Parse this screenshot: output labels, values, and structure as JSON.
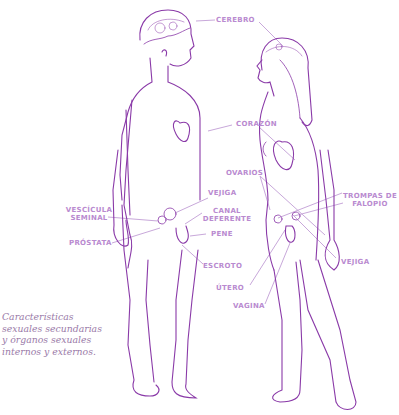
{
  "diagram": {
    "title": "Características sexuales secundarias y órganos sexuales internos y externos",
    "colors": {
      "line": "#8a3aa8",
      "label": "#b98ad0",
      "leader": "#c8a8da",
      "caption": "#9a7aa8"
    },
    "labels": {
      "cerebro": "CEREBRO",
      "corazon": "CORAZÓN",
      "ovarios": "OVARIOS",
      "vejiga_male": "VEJIGA",
      "vesicula_1": "VESCÍCULA",
      "vesicula_2": "SEMINAL",
      "canal_1": "CANAL",
      "canal_2": "DEFERENTE",
      "pene": "PENE",
      "prostata": "PRÓSTATA",
      "escroto": "ESCROTO",
      "trompas_1": "TROMPAS DE",
      "trompas_2": "FALOPIO",
      "vejiga_female": "VEJIGA",
      "utero": "ÚTERO",
      "vagina": "VAGINA"
    },
    "figures": [
      "male-figure",
      "female-figure"
    ]
  },
  "caption": {
    "lines": [
      "Características",
      "sexuales secundarias",
      "y órganos sexuales",
      "internos y externos."
    ]
  }
}
